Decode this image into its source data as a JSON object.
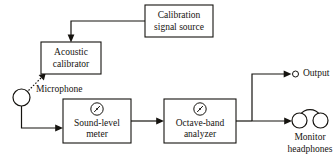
{
  "diagram": {
    "background_color": "#ffffff",
    "line_color": "#15130f",
    "blocks": [
      {
        "id": "calibration-signal-source",
        "label_line1": "Calibration",
        "label_line2": "signal source",
        "x": 145,
        "y": 5,
        "width": 68,
        "height": 32
      },
      {
        "id": "acoustic-calibrator",
        "label_line1": "Acoustic",
        "label_line2": "calibrator",
        "x": 41,
        "y": 42,
        "width": 60,
        "height": 32
      },
      {
        "id": "sound-level-meter",
        "label_line1": "Sound-level",
        "label_line2": "meter",
        "x": 63,
        "y": 99,
        "width": 68,
        "height": 44,
        "has_gauge": true
      },
      {
        "id": "octave-band-analyzer",
        "label_line1": "Octave-band",
        "label_line2": "analyzer",
        "x": 164,
        "y": 99,
        "width": 72,
        "height": 44,
        "has_gauge": true
      }
    ],
    "labels": {
      "microphone": "Microphone",
      "output": "Output",
      "monitor_line1": "Monitor",
      "monitor_line2": "headphones"
    },
    "symbols": {
      "microphone": "microphone-circle",
      "output_terminal": "output-terminal-circle",
      "headphones": "monitor-headphones",
      "gauge": "meter-gauge-icon"
    }
  }
}
